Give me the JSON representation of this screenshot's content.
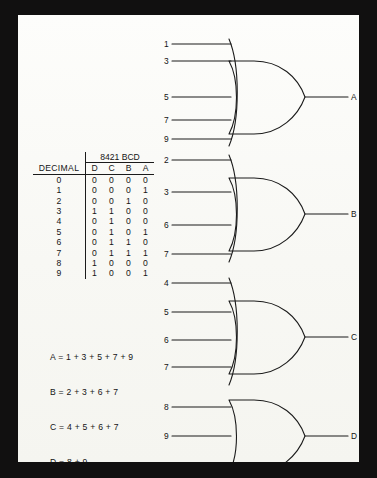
{
  "diagram": {
    "ink_color": "#1b1b1b",
    "paper_color": "#fcfcfa",
    "frame_color": "#111010"
  },
  "truth_table": {
    "group_header": "8421 BCD",
    "decimal_header": "DECIMAL",
    "bit_headers": [
      "D",
      "C",
      "B",
      "A"
    ],
    "rows": [
      {
        "decimal": "0",
        "bits": [
          "0",
          "0",
          "0",
          "0"
        ]
      },
      {
        "decimal": "1",
        "bits": [
          "0",
          "0",
          "0",
          "1"
        ]
      },
      {
        "decimal": "2",
        "bits": [
          "0",
          "0",
          "1",
          "0"
        ]
      },
      {
        "decimal": "3",
        "bits": [
          "1",
          "1",
          "0",
          "0"
        ]
      },
      {
        "decimal": "4",
        "bits": [
          "0",
          "1",
          "0",
          "0"
        ]
      },
      {
        "decimal": "5",
        "bits": [
          "0",
          "1",
          "0",
          "1"
        ]
      },
      {
        "decimal": "6",
        "bits": [
          "0",
          "1",
          "1",
          "0"
        ]
      },
      {
        "decimal": "7",
        "bits": [
          "0",
          "1",
          "1",
          "1"
        ]
      },
      {
        "decimal": "8",
        "bits": [
          "1",
          "0",
          "0",
          "0"
        ]
      },
      {
        "decimal": "9",
        "bits": [
          "1",
          "0",
          "0",
          "1"
        ]
      }
    ]
  },
  "equations": [
    "A = 1 + 3 + 5 + 7 + 9",
    "B = 2 + 3 + 6 + 7",
    "C = 4 + 5 + 6 + 7",
    "D = 8 + 9"
  ],
  "gates": [
    {
      "name": "or-gate-a",
      "output_label": "A",
      "input_labels": [
        "1",
        "3",
        "5",
        "7",
        "9"
      ]
    },
    {
      "name": "or-gate-b",
      "output_label": "B",
      "input_labels": [
        "2",
        "3",
        "6",
        "7"
      ]
    },
    {
      "name": "or-gate-c",
      "output_label": "C",
      "input_labels": [
        "4",
        "5",
        "6",
        "7"
      ]
    },
    {
      "name": "or-gate-d",
      "output_label": "D",
      "input_labels": [
        "8",
        "9"
      ]
    }
  ]
}
